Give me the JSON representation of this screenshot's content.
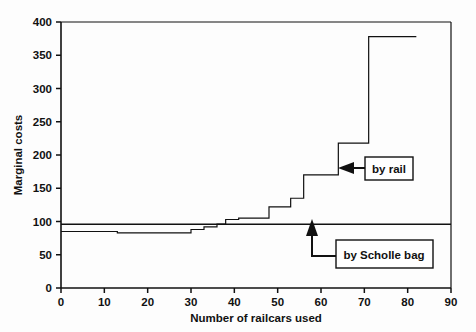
{
  "chart_data": {
    "type": "line",
    "title": "",
    "xlabel": "Number of railcars used",
    "ylabel": "Marginal costs",
    "xlim": [
      0,
      90
    ],
    "ylim": [
      0,
      400
    ],
    "xticks": [
      0,
      10,
      20,
      30,
      40,
      50,
      60,
      70,
      80,
      90
    ],
    "yticks": [
      0,
      50,
      100,
      150,
      200,
      250,
      300,
      350,
      400
    ],
    "grid": false,
    "legend_position": "inline-annotations",
    "series": [
      {
        "name": "by rail",
        "style": "step",
        "annotation": "by rail",
        "points": [
          [
            0,
            85
          ],
          [
            13,
            85
          ],
          [
            13,
            83
          ],
          [
            30,
            83
          ],
          [
            30,
            88
          ],
          [
            33,
            88
          ],
          [
            33,
            92
          ],
          [
            36,
            92
          ],
          [
            36,
            96
          ],
          [
            38,
            96
          ],
          [
            38,
            103
          ],
          [
            41,
            103
          ],
          [
            41,
            105
          ],
          [
            48,
            105
          ],
          [
            48,
            122
          ],
          [
            53,
            122
          ],
          [
            53,
            135
          ],
          [
            56,
            135
          ],
          [
            56,
            170
          ],
          [
            64,
            170
          ],
          [
            64,
            218
          ],
          [
            71,
            218
          ],
          [
            71,
            378
          ],
          [
            82,
            378
          ]
        ]
      },
      {
        "name": "by Scholle bag",
        "style": "constant",
        "annotation": "by Scholle bag",
        "value": 96,
        "x_start": 0,
        "x_end": 90
      }
    ],
    "annotations": [
      {
        "label": "by rail",
        "arrow": "left",
        "target_x": 64,
        "target_y": 195
      },
      {
        "label": "by Scholle bag",
        "arrow": "up",
        "target_x": 60,
        "target_y": 96
      }
    ]
  },
  "axes": {
    "y_title": "Marginal costs",
    "x_title": "Number of railcars used",
    "y_tick_labels": [
      "0",
      "50",
      "100",
      "150",
      "200",
      "250",
      "300",
      "350",
      "400"
    ],
    "x_tick_labels": [
      "0",
      "10",
      "20",
      "30",
      "40",
      "50",
      "60",
      "70",
      "80",
      "90"
    ]
  },
  "labels": {
    "by_rail": "by rail",
    "by_scholle_bag": "by Scholle bag"
  },
  "colors": {
    "line": "#111111",
    "axis": "#111111",
    "background": "#ffffff"
  }
}
